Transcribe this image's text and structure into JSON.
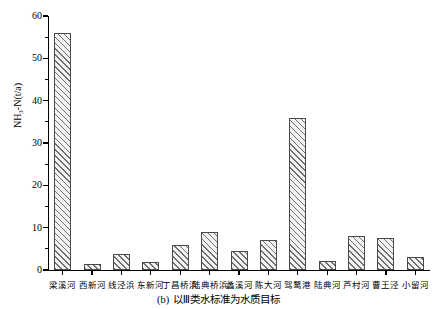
{
  "chart_data": {
    "type": "bar",
    "title": "",
    "caption": "(b) 以Ⅲ类水标准为水质目标",
    "caption_prefix": "(b)",
    "caption_text": "以Ⅲ类水标准为水质目标",
    "xlabel": "",
    "ylabel": "NH3-N(t/a)",
    "ylabel_main": "NH",
    "ylabel_sub": "3",
    "ylabel_tail": "-N(t/a)",
    "ylim": [
      0,
      60
    ],
    "ytick_step": 10,
    "yticks": [
      0,
      10,
      20,
      30,
      40,
      50,
      60
    ],
    "ytick_labels": [
      "0",
      "10",
      "20",
      "30",
      "40",
      "50",
      "60"
    ],
    "yminor_ticks": [
      5,
      15,
      25,
      35,
      45,
      55
    ],
    "grid": false,
    "legend": false,
    "bar_fill": "#f2f2f2",
    "bar_hatch": "diagonal-45",
    "bar_edge_color": "#4a4a4a",
    "categories": [
      "梁溪河",
      "西新河",
      "线泾浜",
      "东新河",
      "丁昌桥浜",
      "陆典桥浜",
      "蠡溪河",
      "陈大河",
      "驾鹜港",
      "陆典河",
      "芦村河",
      "曹王泾",
      "小留河"
    ],
    "values": [
      56,
      1.5,
      3.8,
      2.0,
      6.0,
      9.0,
      4.5,
      7.0,
      36,
      2.2,
      8.0,
      7.5,
      3.0
    ]
  }
}
